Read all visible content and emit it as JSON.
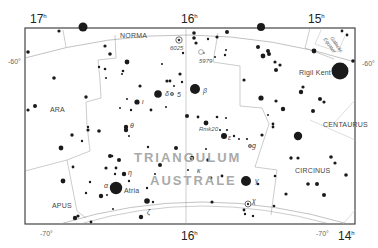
{
  "map": {
    "title": "TRIANGULUM AUSTRALE",
    "title_line1": "TRIANGULUM",
    "title_line2": "AUSTRALE",
    "ra_labels": [
      {
        "text": "17",
        "sup": "h",
        "x": 30,
        "y": 23
      },
      {
        "text": "16",
        "sup": "h",
        "x": 181,
        "y": 23
      },
      {
        "text": "15",
        "sup": "h",
        "x": 308,
        "y": 23
      },
      {
        "text": "16",
        "sup": "h",
        "x": 181,
        "y": 240
      },
      {
        "text": "14",
        "sup": "h",
        "x": 338,
        "y": 240
      }
    ],
    "dec_labels": [
      {
        "text": "-60°",
        "x": 8,
        "y": 64
      },
      {
        "text": "-60°",
        "x": 362,
        "y": 66
      },
      {
        "text": "-70°",
        "x": 40,
        "y": 236
      },
      {
        "text": "-70°",
        "x": 316,
        "y": 236
      }
    ],
    "constellations": [
      {
        "name": "NORMA",
        "x": 120,
        "y": 38
      },
      {
        "name": "ARA",
        "x": 50,
        "y": 112
      },
      {
        "name": "APUS",
        "x": 52,
        "y": 208
      },
      {
        "name": "CENTAURUS",
        "x": 323,
        "y": 127
      },
      {
        "name": "CIRCINUS",
        "x": 295,
        "y": 173
      }
    ],
    "named_objects": [
      {
        "name": "Rigil Kent",
        "x": 299,
        "y": 75
      },
      {
        "name": "Atria",
        "x": 124,
        "y": 193
      },
      {
        "name": "6025",
        "x": 170,
        "y": 50
      },
      {
        "name": "5979",
        "x": 199,
        "y": 63
      },
      {
        "name": "Rmk20",
        "x": 199,
        "y": 131
      },
      {
        "name": "Galactic Equator",
        "x": 330,
        "y": 38
      }
    ],
    "greek_labels": [
      {
        "text": "β",
        "x": 203,
        "y": 93
      },
      {
        "text": "δ",
        "x": 165,
        "y": 96
      },
      {
        "text": "ι",
        "x": 142,
        "y": 104
      },
      {
        "text": "θ",
        "x": 130,
        "y": 128
      },
      {
        "text": "ε",
        "x": 228,
        "y": 140
      },
      {
        "text": "g",
        "x": 252,
        "y": 148
      },
      {
        "text": "η",
        "x": 128,
        "y": 175
      },
      {
        "text": "α",
        "x": 104,
        "y": 188
      },
      {
        "text": "κ",
        "x": 197,
        "y": 173
      },
      {
        "text": "γ",
        "x": 255,
        "y": 183
      },
      {
        "text": "ζ",
        "x": 147,
        "y": 214
      },
      {
        "text": "χ",
        "x": 252,
        "y": 203
      },
      {
        "text": "5",
        "x": 177,
        "y": 97
      }
    ],
    "stars": [
      {
        "x": 83,
        "y": 27,
        "r": 4.5
      },
      {
        "x": 59,
        "y": 31,
        "r": 1.6
      },
      {
        "x": 28,
        "y": 52,
        "r": 1.8
      },
      {
        "x": 105,
        "y": 46,
        "r": 1.6
      },
      {
        "x": 110,
        "y": 54,
        "r": 1.8
      },
      {
        "x": 127,
        "y": 62,
        "r": 2.4
      },
      {
        "x": 99,
        "y": 67,
        "r": 1.2
      },
      {
        "x": 105,
        "y": 69,
        "r": 1.3
      },
      {
        "x": 123,
        "y": 71,
        "r": 1.3
      },
      {
        "x": 122,
        "y": 74,
        "r": 1.0
      },
      {
        "x": 106,
        "y": 78,
        "r": 1.0
      },
      {
        "x": 54,
        "y": 78,
        "r": 1.8
      },
      {
        "x": 162,
        "y": 64,
        "r": 1.0
      },
      {
        "x": 180,
        "y": 74,
        "r": 1.6
      },
      {
        "x": 167,
        "y": 81,
        "r": 1.6
      },
      {
        "x": 170,
        "y": 81,
        "r": 1.4
      },
      {
        "x": 174,
        "y": 86,
        "r": 1.0
      },
      {
        "x": 182,
        "y": 82,
        "r": 1.2
      },
      {
        "x": 140,
        "y": 86,
        "r": 1.6
      },
      {
        "x": 158,
        "y": 94,
        "r": 3.8
      },
      {
        "x": 195,
        "y": 89,
        "r": 5.0
      },
      {
        "x": 137,
        "y": 102,
        "r": 2.6
      },
      {
        "x": 127,
        "y": 99,
        "r": 1.0
      },
      {
        "x": 120,
        "y": 108,
        "r": 1.0
      },
      {
        "x": 131,
        "y": 110,
        "r": 1.2
      },
      {
        "x": 151,
        "y": 110,
        "r": 1.4
      },
      {
        "x": 86,
        "y": 97,
        "r": 1.7
      },
      {
        "x": 35,
        "y": 106,
        "r": 2.0
      },
      {
        "x": 28,
        "y": 110,
        "r": 1.6
      },
      {
        "x": 166,
        "y": 107,
        "r": 1.0
      },
      {
        "x": 187,
        "y": 116,
        "r": 2.0
      },
      {
        "x": 198,
        "y": 117,
        "r": 1.4
      },
      {
        "x": 206,
        "y": 123,
        "r": 2.4
      },
      {
        "x": 217,
        "y": 117,
        "r": 1.3
      },
      {
        "x": 226,
        "y": 118,
        "r": 1.0
      },
      {
        "x": 126,
        "y": 127,
        "r": 2.2
      },
      {
        "x": 129,
        "y": 136,
        "r": 1.0
      },
      {
        "x": 88,
        "y": 130,
        "r": 1.6
      },
      {
        "x": 99,
        "y": 131,
        "r": 1.8
      },
      {
        "x": 224,
        "y": 136,
        "r": 3.0
      },
      {
        "x": 220,
        "y": 130,
        "r": 1.0
      },
      {
        "x": 227,
        "y": 130,
        "r": 1.1
      },
      {
        "x": 234,
        "y": 136,
        "r": 1.2
      },
      {
        "x": 239,
        "y": 139,
        "r": 1.0
      },
      {
        "x": 247,
        "y": 139,
        "r": 1.1
      },
      {
        "x": 206,
        "y": 149,
        "r": 1.0
      },
      {
        "x": 72,
        "y": 135,
        "r": 1.7
      },
      {
        "x": 61,
        "y": 148,
        "r": 2.4
      },
      {
        "x": 82,
        "y": 141,
        "r": 1.2
      },
      {
        "x": 88,
        "y": 127,
        "r": 1.2
      },
      {
        "x": 126,
        "y": 130,
        "r": 2.2
      },
      {
        "x": 110,
        "y": 156,
        "r": 2.0
      },
      {
        "x": 112,
        "y": 156,
        "r": 1.3
      },
      {
        "x": 119,
        "y": 160,
        "r": 2.0
      },
      {
        "x": 116,
        "y": 168,
        "r": 1.4
      },
      {
        "x": 106,
        "y": 168,
        "r": 1.6
      },
      {
        "x": 148,
        "y": 147,
        "r": 1.2
      },
      {
        "x": 160,
        "y": 165,
        "r": 2.0
      },
      {
        "x": 155,
        "y": 174,
        "r": 1.0
      },
      {
        "x": 115,
        "y": 174,
        "r": 1.2
      },
      {
        "x": 124,
        "y": 174,
        "r": 2.2
      },
      {
        "x": 129,
        "y": 181,
        "r": 1.2
      },
      {
        "x": 116,
        "y": 188,
        "r": 6.2
      },
      {
        "x": 101,
        "y": 196,
        "r": 2.2
      },
      {
        "x": 107,
        "y": 195,
        "r": 1.0
      },
      {
        "x": 90,
        "y": 182,
        "r": 1.2
      },
      {
        "x": 86,
        "y": 193,
        "r": 1.2
      },
      {
        "x": 73,
        "y": 167,
        "r": 1.4
      },
      {
        "x": 63,
        "y": 181,
        "r": 2.4
      },
      {
        "x": 147,
        "y": 188,
        "r": 1.2
      },
      {
        "x": 147,
        "y": 201,
        "r": 2.8
      },
      {
        "x": 153,
        "y": 202,
        "r": 1.2
      },
      {
        "x": 141,
        "y": 217,
        "r": 2.2
      },
      {
        "x": 113,
        "y": 209,
        "r": 1.0
      },
      {
        "x": 78,
        "y": 216,
        "r": 1.6
      },
      {
        "x": 75,
        "y": 218,
        "r": 2.2
      },
      {
        "x": 91,
        "y": 222,
        "r": 1.4
      },
      {
        "x": 192,
        "y": 158,
        "r": 2.2
      },
      {
        "x": 176,
        "y": 148,
        "r": 2.0
      },
      {
        "x": 208,
        "y": 160,
        "r": 1.8
      },
      {
        "x": 188,
        "y": 170,
        "r": 1.0
      },
      {
        "x": 211,
        "y": 178,
        "r": 1.4
      },
      {
        "x": 246,
        "y": 181,
        "r": 5.0
      },
      {
        "x": 222,
        "y": 176,
        "r": 1.4
      },
      {
        "x": 258,
        "y": 184,
        "r": 1.3
      },
      {
        "x": 212,
        "y": 202,
        "r": 1.6
      },
      {
        "x": 244,
        "y": 210,
        "r": 1.4
      },
      {
        "x": 245,
        "y": 214,
        "r": 1.2
      },
      {
        "x": 253,
        "y": 216,
        "r": 1.2
      },
      {
        "x": 274,
        "y": 206,
        "r": 1.3
      },
      {
        "x": 275,
        "y": 176,
        "r": 1.3
      },
      {
        "x": 286,
        "y": 194,
        "r": 1.6
      },
      {
        "x": 308,
        "y": 184,
        "r": 1.8
      },
      {
        "x": 317,
        "y": 184,
        "r": 2.0
      },
      {
        "x": 324,
        "y": 195,
        "r": 2.0
      },
      {
        "x": 291,
        "y": 158,
        "r": 1.7
      },
      {
        "x": 298,
        "y": 136,
        "r": 4.2
      },
      {
        "x": 298,
        "y": 158,
        "r": 1.6
      },
      {
        "x": 331,
        "y": 157,
        "r": 1.8
      },
      {
        "x": 335,
        "y": 163,
        "r": 1.6
      },
      {
        "x": 346,
        "y": 175,
        "r": 1.8
      },
      {
        "x": 273,
        "y": 127,
        "r": 1.4
      },
      {
        "x": 273,
        "y": 124,
        "r": 1.4
      },
      {
        "x": 262,
        "y": 135,
        "r": 1.6
      },
      {
        "x": 244,
        "y": 80,
        "r": 1.6
      },
      {
        "x": 268,
        "y": 51,
        "r": 2.0
      },
      {
        "x": 258,
        "y": 47,
        "r": 2.0
      },
      {
        "x": 269,
        "y": 54,
        "r": 2.0
      },
      {
        "x": 263,
        "y": 56,
        "r": 2.4
      },
      {
        "x": 275,
        "y": 62,
        "r": 1.6
      },
      {
        "x": 280,
        "y": 65,
        "r": 1.6
      },
      {
        "x": 276,
        "y": 70,
        "r": 2.0
      },
      {
        "x": 261,
        "y": 98,
        "r": 2.6
      },
      {
        "x": 276,
        "y": 101,
        "r": 1.6
      },
      {
        "x": 283,
        "y": 109,
        "r": 2.2
      },
      {
        "x": 268,
        "y": 115,
        "r": 1.0
      },
      {
        "x": 303,
        "y": 87,
        "r": 1.6
      },
      {
        "x": 301,
        "y": 92,
        "r": 2.2
      },
      {
        "x": 320,
        "y": 99,
        "r": 2.0
      },
      {
        "x": 324,
        "y": 102,
        "r": 1.6
      },
      {
        "x": 313,
        "y": 111,
        "r": 2.0
      },
      {
        "x": 314,
        "y": 51,
        "r": 2.4
      },
      {
        "x": 340,
        "y": 71,
        "r": 8.5
      },
      {
        "x": 353,
        "y": 61,
        "r": 1.8
      },
      {
        "x": 342,
        "y": 31,
        "r": 1.4
      },
      {
        "x": 347,
        "y": 35,
        "r": 1.4
      },
      {
        "x": 261,
        "y": 27,
        "r": 4.0
      },
      {
        "x": 227,
        "y": 32,
        "r": 2.0
      },
      {
        "x": 194,
        "y": 33,
        "r": 1.8
      },
      {
        "x": 194,
        "y": 38,
        "r": 1.8
      },
      {
        "x": 196,
        "y": 43,
        "r": 1.6
      },
      {
        "x": 208,
        "y": 39,
        "r": 1.2
      },
      {
        "x": 217,
        "y": 37,
        "r": 1.6
      },
      {
        "x": 226,
        "y": 50,
        "r": 1.0
      },
      {
        "x": 225,
        "y": 55,
        "r": 1.2
      },
      {
        "x": 215,
        "y": 57,
        "r": 1.0
      },
      {
        "x": 183,
        "y": 53,
        "r": 1.2
      }
    ],
    "clusters": [
      {
        "x": 179,
        "y": 40,
        "r": 3.2,
        "type": "open-cluster"
      },
      {
        "x": 248,
        "y": 204,
        "r": 3.0,
        "type": "open-cluster"
      },
      {
        "x": 172,
        "y": 94,
        "r": 1.6,
        "type": "open-cluster-small"
      },
      {
        "x": 250,
        "y": 146,
        "r": 1.6,
        "type": "open-cluster-small"
      },
      {
        "x": 201,
        "y": 52,
        "r": 2.4,
        "type": "planetary-nebula"
      }
    ]
  }
}
